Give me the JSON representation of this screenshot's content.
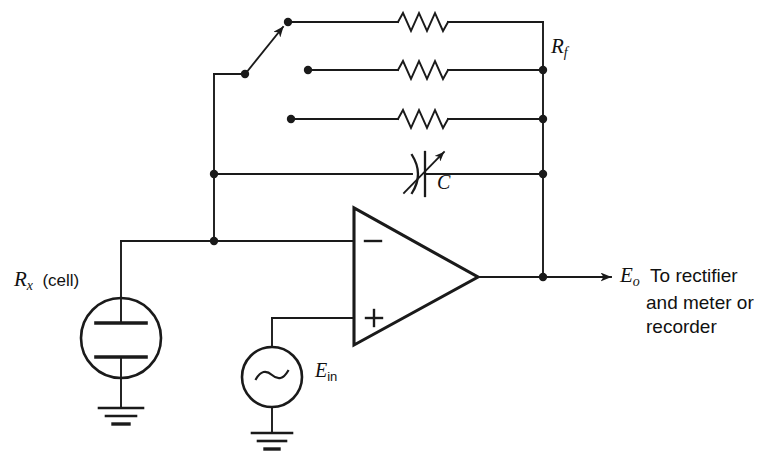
{
  "figure": {
    "type": "circuit-schematic",
    "width": 770,
    "height": 466,
    "background_color": "#ffffff",
    "line_color": "#1a1a1a"
  },
  "labels": {
    "feedback_resistor": {
      "symbol": "R",
      "subscript": "f",
      "full": "Rf"
    },
    "feedback_capacitor": {
      "symbol": "C",
      "subscript": "",
      "full": "C"
    },
    "cell_resistor": {
      "symbol": "R",
      "subscript": "x",
      "suffix": "(cell)",
      "full": "Rx (cell)"
    },
    "input_source": {
      "symbol": "E",
      "subscript": "in",
      "full": "Ein"
    },
    "output": {
      "symbol": "E",
      "subscript": "o",
      "line1": "To rectifier",
      "line2": "and meter or",
      "line3": "recorder",
      "full": "Eo To rectifier and meter or recorder"
    },
    "opamp_inverting_input": "−",
    "opamp_noninverting_input": "+",
    "ac_source_waveform": "∼"
  },
  "components": {
    "feedback_resistors": [
      {
        "name": "resistor-top",
        "row": 1,
        "selected": true
      },
      {
        "name": "resistor-middle",
        "row": 2,
        "selected": false
      },
      {
        "name": "resistor-bottom",
        "row": 3,
        "selected": false
      }
    ],
    "rotary_switch": {
      "name": "range-selector-switch",
      "position": 1,
      "positions": 3
    },
    "variable_capacitor": {
      "name": "variable-capacitor",
      "variable": true
    },
    "conductivity_cell": {
      "name": "conductivity-cell",
      "plates": 2,
      "grounded": true
    },
    "ac_generator": {
      "name": "ac-signal-generator",
      "grounded": true
    },
    "operational_amplifier": {
      "name": "operational-amplifier",
      "inputs": 2
    }
  }
}
